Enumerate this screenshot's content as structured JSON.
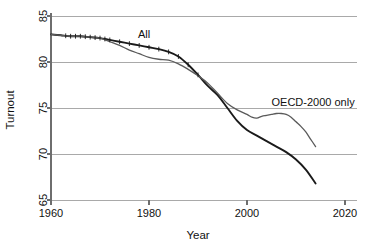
{
  "chart_data": {
    "type": "line",
    "title": "",
    "xlabel": "Year",
    "ylabel": "Turnout",
    "xlim": [
      1960,
      2020
    ],
    "ylim": [
      65,
      85
    ],
    "xticks": [
      1960,
      1980,
      2000,
      2020
    ],
    "yticks": [
      65,
      70,
      75,
      80,
      85
    ],
    "xtick_labels": [
      "1960",
      "1980",
      "2000",
      "2020"
    ],
    "ytick_labels": [
      "65",
      "70",
      "75",
      "80",
      "85"
    ],
    "grid": "horizontal",
    "legend_position": "inline-annotations",
    "series": [
      {
        "name": "All",
        "label": "All",
        "color": "#1a1a1a",
        "annotation_x": 1979,
        "annotation_y": 82.6,
        "x": [
          1960,
          1962,
          1964,
          1966,
          1968,
          1970,
          1972,
          1974,
          1976,
          1978,
          1980,
          1982,
          1984,
          1986,
          1988,
          1990,
          1992,
          1994,
          1996,
          1998,
          2000,
          2002,
          2004,
          2006,
          2008,
          2010,
          2012,
          2014
        ],
        "y": [
          83.0,
          82.9,
          82.8,
          82.8,
          82.7,
          82.6,
          82.4,
          82.2,
          82.0,
          81.8,
          81.6,
          81.4,
          81.1,
          80.6,
          79.7,
          78.6,
          77.4,
          76.4,
          75.0,
          73.6,
          72.6,
          72.0,
          71.4,
          70.8,
          70.2,
          69.4,
          68.3,
          66.8
        ]
      },
      {
        "name": "OECD-2000 only",
        "label": "OECD-2000 only",
        "color": "#5a5a5a",
        "annotation_x": 2005,
        "annotation_y": 75.2,
        "x": [
          1960,
          1962,
          1964,
          1966,
          1968,
          1970,
          1972,
          1974,
          1976,
          1978,
          1980,
          1982,
          1984,
          1986,
          1988,
          1990,
          1992,
          1994,
          1996,
          1998,
          2000,
          2001,
          2002,
          2003,
          2004,
          2005,
          2006,
          2007,
          2008,
          2009,
          2010,
          2011,
          2012,
          2013,
          2014
        ],
        "y": [
          83.0,
          82.9,
          82.8,
          82.8,
          82.7,
          82.6,
          82.2,
          81.8,
          81.3,
          80.9,
          80.5,
          80.3,
          80.2,
          79.8,
          79.2,
          78.5,
          77.7,
          76.6,
          75.5,
          74.8,
          74.3,
          74.0,
          73.9,
          74.1,
          74.2,
          74.3,
          74.4,
          74.4,
          74.3,
          74.0,
          73.5,
          73.0,
          72.4,
          71.6,
          70.8
        ]
      }
    ],
    "rug_marks": {
      "series": "All",
      "x": [
        1963,
        1964,
        1965,
        1966,
        1967,
        1968,
        1969,
        1970,
        1971,
        1972,
        1974,
        1976,
        1978,
        1980,
        1982,
        1984,
        1986,
        1988,
        1990
      ]
    }
  },
  "axes": {
    "y_title": "Turnout",
    "x_title": "Year"
  }
}
